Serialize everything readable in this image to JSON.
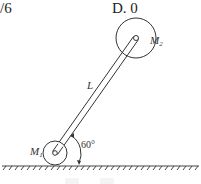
{
  "options": {
    "partial_option_text": "/6",
    "option_d": "D.  0"
  },
  "diagram": {
    "mass_top_label": "M",
    "mass_top_sub": "2",
    "mass_bottom_label": "M",
    "mass_bottom_sub": "1",
    "rod_label": "L",
    "angle_label": "60°",
    "colors": {
      "stroke": "#333333",
      "background": "#ffffff"
    }
  }
}
